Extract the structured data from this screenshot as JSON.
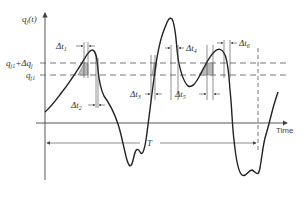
{
  "diagram": {
    "y_axis_label": "q",
    "y_axis_label_sub": "j",
    "y_axis_label_arg": "(t)",
    "x_axis_label": "Time",
    "upper_level_label": "q",
    "upper_level_sub": "j1",
    "upper_level_plus": "+Δq",
    "upper_level_plus_sub": "j",
    "lower_level_label": "q",
    "lower_level_sub": "j1",
    "period_label": "T",
    "intervals": [
      {
        "label": "Δt",
        "sub": "1"
      },
      {
        "label": "Δt",
        "sub": "2"
      },
      {
        "label": "Δt",
        "sub": "3"
      },
      {
        "label": "Δt",
        "sub": "4"
      },
      {
        "label": "Δt",
        "sub": "5"
      },
      {
        "label": "Δt",
        "sub": "6"
      }
    ],
    "colors": {
      "line": "#222222",
      "shade": "#b8b8b8",
      "background": "#ffffff"
    }
  }
}
